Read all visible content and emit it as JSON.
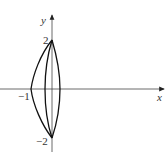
{
  "diagram": {
    "axes": {
      "x_label": "x",
      "y_label": "y",
      "origin_px": [
        52,
        89
      ]
    },
    "tick_labels": {
      "y_top": "2",
      "y_bottom": "−2",
      "x_left": "−1"
    },
    "curves": [
      {
        "name": "outer-left-curve",
        "description": "from (0,2) bulging left to (-1,0) then to (0,-2)"
      },
      {
        "name": "inner-left-curve",
        "description": "from (0,2) slightly left of y-axis down to (0,-2)"
      },
      {
        "name": "right-curve",
        "description": "from (0,2) slightly right of y-axis down to (0,-2)"
      }
    ],
    "colors": {
      "stroke": "#111111",
      "axis": "#333333"
    }
  }
}
